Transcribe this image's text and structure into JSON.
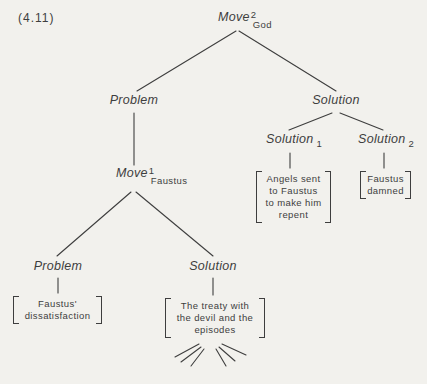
{
  "figure_label": "(4.11)",
  "colors": {
    "background": "#f2f1ed",
    "ink": "#3e3e3e"
  },
  "nodes": {
    "root": {
      "label": "Move",
      "superscript": "2",
      "subscript": "God"
    },
    "problem_l1": {
      "label": "Problem"
    },
    "solution_l1": {
      "label": "Solution"
    },
    "solution_1": {
      "label": "Solution",
      "subscript": "1",
      "content": [
        "Angels sent",
        "to Faustus",
        "to make him",
        "repent"
      ]
    },
    "solution_2": {
      "label": "Solution",
      "subscript": "2",
      "content": [
        "Faustus",
        "damned"
      ]
    },
    "move_1": {
      "label": "Move",
      "superscript": "1",
      "subscript": "Faustus"
    },
    "problem_l2": {
      "label": "Problem",
      "content": [
        "Faustus'",
        "dissatisfaction"
      ]
    },
    "solution_l2": {
      "label": "Solution",
      "content": [
        "The treaty with",
        "the devil and the",
        "episodes"
      ]
    }
  }
}
